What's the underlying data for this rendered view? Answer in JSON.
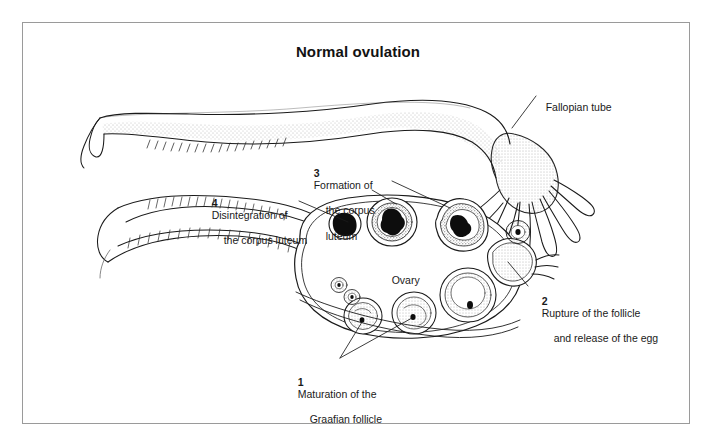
{
  "figure": {
    "title": "Normal ovulation",
    "type": "anatomical-line-drawing",
    "border_color": "#9a9a9a",
    "background_color": "#ffffff",
    "ink_color": "#1a1a1a"
  },
  "labels": {
    "fallopian_tube": "Fallopian tube",
    "ovary": "Ovary",
    "step1": {
      "number": "1",
      "line1": "Maturation of the",
      "line2": "Graafian follicle"
    },
    "step2": {
      "number": "2",
      "line1": "Rupture of the follicle",
      "line2": "and release of the egg"
    },
    "step3": {
      "number": "3",
      "line1": "Formation of",
      "line2": "the corpus",
      "line3": "luteum"
    },
    "step4": {
      "number": "4",
      "line1": "Disintegration of",
      "line2": "the corpus luteum"
    }
  },
  "diagram_structures": [
    {
      "name": "fallopian-tube",
      "description": "long curving tube with stippled shading running across the upper half"
    },
    {
      "name": "fimbriae",
      "description": "finger-like projections at the right end of the fallopian tube"
    },
    {
      "name": "broad-ligament",
      "description": "hatched membrane below the fallopian tube"
    },
    {
      "name": "ovary-body",
      "description": "large oval organ in the centre-lower area"
    },
    {
      "name": "primordial-follicles",
      "count": "2",
      "description": "two tiny stippled follicles at lower left of ovary"
    },
    {
      "name": "developing-follicles",
      "count": "2",
      "description": "two mid-size follicles with stippled interior and dark ovum"
    },
    {
      "name": "graafian-follicle",
      "count": "1",
      "description": "large mature follicle on the right of the ovary"
    },
    {
      "name": "ruptured-follicle",
      "count": "1",
      "description": "bulging follicle at the right edge releasing the egg"
    },
    {
      "name": "released-egg",
      "count": "1",
      "description": "small round ovum above the rupture site"
    },
    {
      "name": "corpus-luteum-forming",
      "count": "1",
      "description": "follicle with thick granulosa ring and dark centre, right of top row"
    },
    {
      "name": "corpus-luteum-mature",
      "count": "1",
      "description": "large ring structure with dark star-shaped centre, middle of top row"
    },
    {
      "name": "corpus-luteum-degenerating",
      "count": "1",
      "description": "small dark irregular body at the left of the top row"
    }
  ]
}
